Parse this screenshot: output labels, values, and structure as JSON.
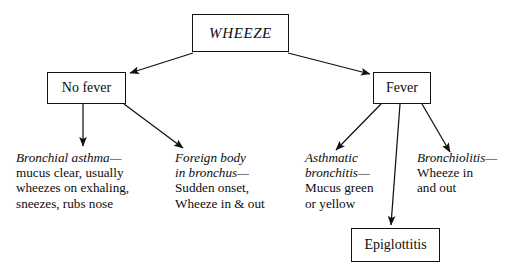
{
  "diagram": {
    "title": "WHEEZE",
    "root": {
      "label": "WHEEZE"
    },
    "branches": {
      "left": {
        "label": "No fever"
      },
      "right": {
        "label": "Fever"
      }
    },
    "outcome": {
      "label": "Epiglottitis"
    },
    "leaves": [
      {
        "name": "bronchial-asthma",
        "term": "Bronchial asthma—",
        "detail_lines": [
          "mucus clear, usually",
          "wheezes on exhaling,",
          "sneezes, rubs nose"
        ]
      },
      {
        "name": "foreign-body",
        "term_lines": [
          "Foreign body",
          "in bronchus—"
        ],
        "detail_lines": [
          "Sudden onset,",
          "Wheeze in & out"
        ]
      },
      {
        "name": "asthmatic-bronchitis",
        "term_lines": [
          "Asthmatic",
          "bronchitis—"
        ],
        "detail_lines": [
          "Mucus green",
          "or yellow"
        ]
      },
      {
        "name": "bronchiolitis",
        "term": "Bronchiolitis—",
        "detail_lines": [
          "Wheeze in",
          "and out"
        ]
      }
    ],
    "colors": {
      "background": "#ffffff",
      "stroke": "#111111",
      "text": "#0d0d0d"
    }
  }
}
